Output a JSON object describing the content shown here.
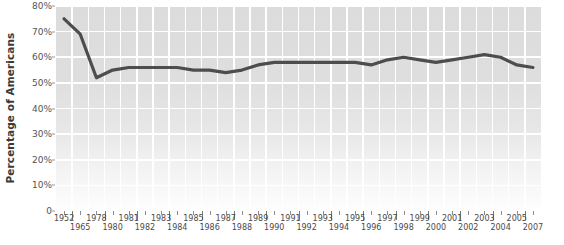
{
  "chart_data": {
    "type": "line",
    "title": "",
    "xlabel": "",
    "ylabel": "Percentage of Americans",
    "ylim": [
      0,
      80
    ],
    "ytick_values": [
      80,
      70,
      60,
      50,
      40,
      30,
      20,
      10,
      0
    ],
    "ytick_labels": [
      "80%",
      "70%",
      "60%",
      "50%",
      "40%",
      "30%",
      "20%",
      "10%",
      "0"
    ],
    "grid": true,
    "legend": "none",
    "categories": [
      "1952",
      "1965",
      "1978",
      "1980",
      "1981",
      "1982",
      "1983",
      "1984",
      "1985",
      "1986",
      "1987",
      "1988",
      "1989",
      "1990",
      "1991",
      "1992",
      "1993",
      "1994",
      "1995",
      "1996",
      "1997",
      "1998",
      "1999",
      "2000",
      "2001",
      "2002",
      "2003",
      "2004",
      "2005",
      "2007"
    ],
    "category_rows": [
      "top",
      "bottom",
      "top",
      "bottom",
      "top",
      "bottom",
      "top",
      "bottom",
      "top",
      "bottom",
      "top",
      "bottom",
      "top",
      "bottom",
      "top",
      "bottom",
      "top",
      "bottom",
      "top",
      "bottom",
      "top",
      "bottom",
      "top",
      "bottom",
      "top",
      "bottom",
      "top",
      "bottom",
      "top",
      "bottom"
    ],
    "values": [
      75,
      69,
      52,
      55,
      56,
      56,
      56,
      56,
      55,
      55,
      54,
      55,
      57,
      58,
      58,
      58,
      58,
      58,
      58,
      57,
      59,
      60,
      59,
      58,
      59,
      60,
      61,
      60,
      57,
      56
    ],
    "series": [
      {
        "name": "Percentage of Americans",
        "color": "#4d4d4d",
        "values": [
          75,
          69,
          52,
          55,
          56,
          56,
          56,
          56,
          55,
          55,
          54,
          55,
          57,
          58,
          58,
          58,
          58,
          58,
          58,
          57,
          59,
          60,
          59,
          58,
          59,
          60,
          61,
          60,
          57,
          56
        ]
      }
    ]
  },
  "colors": {
    "line": "#4d4d4d",
    "plot_background_top": "#dcdcdc",
    "plot_background_bottom": "#fefefe",
    "gridline": "#ffffff",
    "axis_text": "#555555",
    "axis_title": "#3a3a3a"
  }
}
